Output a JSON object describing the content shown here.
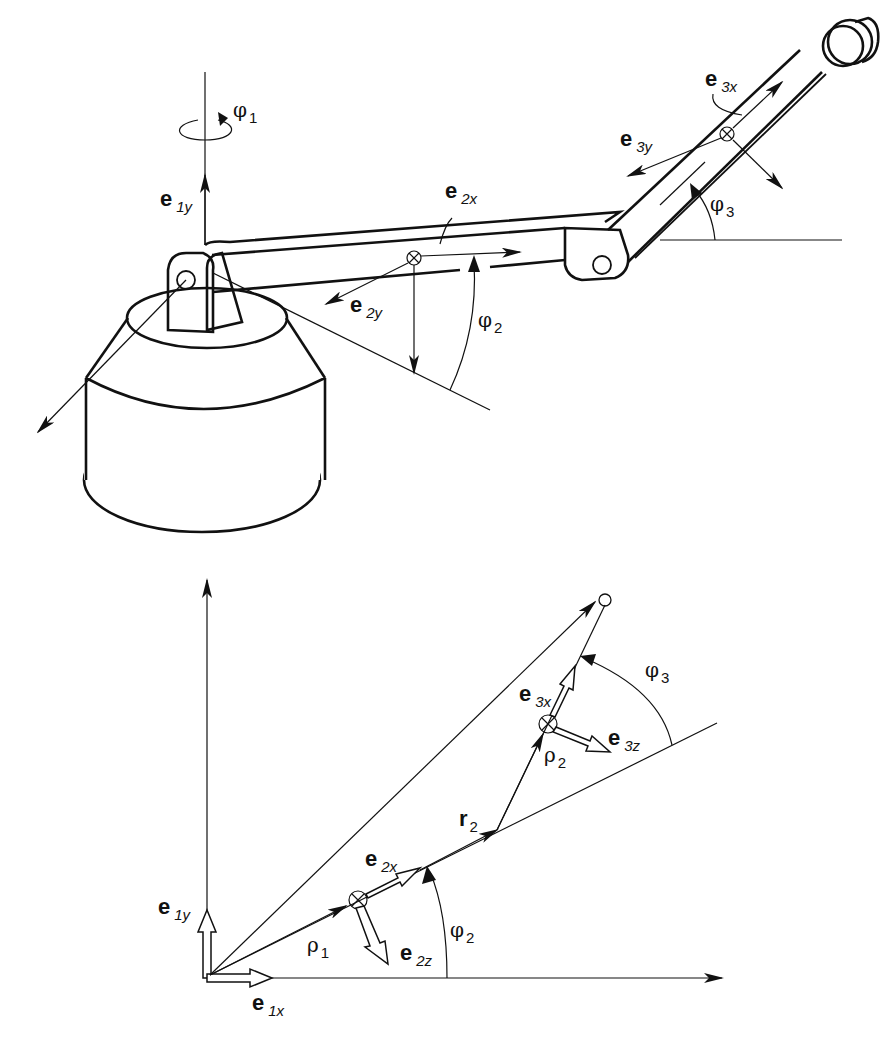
{
  "figure": {
    "top_view": {
      "title": "Three-link robot arm (perspective)",
      "labels": {
        "phi1": {
          "sym": "φ",
          "sub": "1"
        },
        "e1y": {
          "sym": "e",
          "sub": "1y"
        },
        "e2x": {
          "sym": "e",
          "sub": "2x"
        },
        "e2y": {
          "sym": "e",
          "sub": "2y"
        },
        "phi2": {
          "sym": "φ",
          "sub": "2"
        },
        "e3x": {
          "sym": "e",
          "sub": "3x"
        },
        "e3y": {
          "sym": "e",
          "sub": "3y"
        },
        "phi3": {
          "sym": "φ",
          "sub": "3"
        }
      }
    },
    "bottom_view": {
      "title": "Planar kinematic vector diagram",
      "labels": {
        "e1y": {
          "sym": "e",
          "sub": "1y"
        },
        "e1x": {
          "sym": "e",
          "sub": "1x"
        },
        "e2x": {
          "sym": "e",
          "sub": "2x"
        },
        "e2z": {
          "sym": "e",
          "sub": "2z"
        },
        "rho1": {
          "sym": "ρ",
          "sub": "1"
        },
        "phi2": {
          "sym": "φ",
          "sub": "2"
        },
        "r2": {
          "sym": "r",
          "sub": "2"
        },
        "e3x": {
          "sym": "e",
          "sub": "3x"
        },
        "e3z": {
          "sym": "e",
          "sub": "3z"
        },
        "rho2": {
          "sym": "ρ",
          "sub": "2"
        },
        "phi3": {
          "sym": "φ",
          "sub": "3"
        }
      }
    },
    "colors": {
      "ink": "#111111",
      "background": "#ffffff"
    }
  }
}
